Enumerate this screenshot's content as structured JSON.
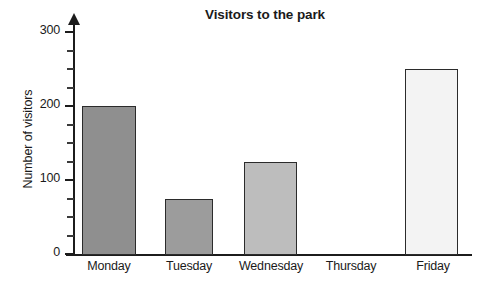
{
  "chart_data": {
    "type": "bar",
    "title": "Visitors to the park",
    "xlabel": "",
    "ylabel": "Number of visitors",
    "categories": [
      "Monday",
      "Tuesday",
      "Wednesday",
      "Thursday",
      "Friday"
    ],
    "values": [
      200,
      75,
      125,
      0,
      250
    ],
    "series": [
      {
        "name": "Number of visitors",
        "values": [
          200,
          75,
          125,
          0,
          250
        ]
      }
    ],
    "ylim": [
      0,
      300
    ],
    "y_major_ticks": [
      0,
      100,
      200,
      300
    ],
    "y_tick_labels": [
      "0",
      "100",
      "200",
      "300"
    ],
    "y_minor_tick_step": 25,
    "grid": false,
    "legend": null,
    "bar_colors": [
      "#8f8f8f",
      "#9c9c9c",
      "#bdbdbd",
      "#ffffff",
      "#f3f3f3"
    ],
    "bar_border_color": "#2b2b2b",
    "axis_color": "#1c1c1c",
    "background": "#ffffff"
  },
  "bars": [
    {
      "category": "Monday",
      "value": 200,
      "color": "#8f8f8f",
      "left": 82,
      "width": 54,
      "visible": true
    },
    {
      "category": "Tuesday",
      "value": 75,
      "color": "#9c9c9c",
      "left": 165,
      "width": 48,
      "visible": true
    },
    {
      "category": "Wednesday",
      "value": 125,
      "color": "#bdbdbd",
      "left": 244,
      "width": 53,
      "visible": true
    },
    {
      "category": "Thursday",
      "value": 0,
      "color": "#ffffff",
      "left": 324,
      "width": 53,
      "visible": false
    },
    {
      "category": "Friday",
      "value": 250,
      "color": "#f3f3f3",
      "left": 405,
      "width": 53,
      "visible": true
    }
  ],
  "category_label_positions": [
    {
      "label": "Monday",
      "left": 69,
      "width": 80
    },
    {
      "label": "Tuesday",
      "left": 149,
      "width": 80
    },
    {
      "label": "Wednesday",
      "left": 225,
      "width": 92
    },
    {
      "label": "Thursday",
      "left": 310,
      "width": 82
    },
    {
      "label": "Friday",
      "left": 394,
      "width": 78
    }
  ],
  "y_axis": {
    "major": [
      {
        "label": "300",
        "value": 300
      },
      {
        "label": "200",
        "value": 200
      },
      {
        "label": "100",
        "value": 100
      },
      {
        "label": "0",
        "value": 0
      }
    ],
    "minor_values": [
      25,
      50,
      75,
      125,
      150,
      175,
      225,
      250,
      275
    ]
  }
}
